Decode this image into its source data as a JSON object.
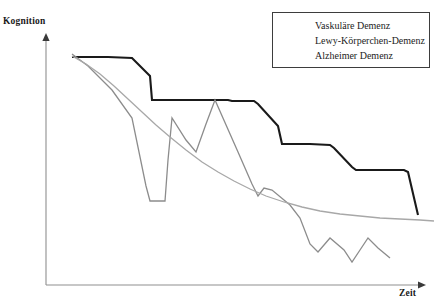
{
  "chart_data": {
    "type": "line",
    "title": "",
    "xlabel": "Zeit",
    "ylabel": "Kognition",
    "grid": false,
    "axes_style": "arrow-ended L-shaped axes, no tick labels",
    "legend_position": "top-right",
    "xlim": [
      0,
      100
    ],
    "ylim": [
      0,
      100
    ],
    "series": [
      {
        "name": "Vaskuläre Demenz",
        "color": "#1a1a1a",
        "width": 2.1,
        "shape": "descending staircase with flat plateaus and abrupt drops",
        "points": [
          [
            72,
            57
          ],
          [
            105,
            57
          ],
          [
            108,
            57
          ],
          [
            132,
            58
          ],
          [
            150,
            76
          ],
          [
            152,
            100
          ],
          [
            190,
            100
          ],
          [
            228,
            100
          ],
          [
            232,
            101
          ],
          [
            254,
            101
          ],
          [
            258,
            104
          ],
          [
            278,
            126
          ],
          [
            282,
            144
          ],
          [
            310,
            144
          ],
          [
            330,
            145
          ],
          [
            334,
            148
          ],
          [
            352,
            167
          ],
          [
            356,
            170
          ],
          [
            390,
            170
          ],
          [
            404,
            170
          ],
          [
            408,
            172
          ],
          [
            418,
            215
          ]
        ]
      },
      {
        "name": "Lewy-Körperchen-Demenz",
        "color": "#8c8c8c",
        "width": 1.3,
        "shape": "steeply fluctuating zigzag with deep troughs and sharp peaks",
        "points": [
          [
            72,
            54
          ],
          [
            88,
            66
          ],
          [
            112,
            90
          ],
          [
            132,
            118
          ],
          [
            146,
            186
          ],
          [
            150,
            201
          ],
          [
            165,
            201
          ],
          [
            168,
            160
          ],
          [
            172,
            118
          ],
          [
            186,
            140
          ],
          [
            196,
            152
          ],
          [
            206,
            124
          ],
          [
            215,
            100
          ],
          [
            238,
            152
          ],
          [
            252,
            184
          ],
          [
            258,
            196
          ],
          [
            264,
            188
          ],
          [
            272,
            190
          ],
          [
            290,
            205
          ],
          [
            300,
            218
          ],
          [
            310,
            244
          ],
          [
            318,
            252
          ],
          [
            330,
            238
          ],
          [
            344,
            250
          ],
          [
            352,
            262
          ],
          [
            360,
            250
          ],
          [
            368,
            238
          ],
          [
            378,
            248
          ],
          [
            390,
            258
          ]
        ]
      },
      {
        "name": "Alzheimer Demenz",
        "color": "#a8a8a8",
        "width": 1.3,
        "shape": "smooth gradual exponential-like decay flattening to a plateau",
        "points": [
          [
            72,
            56
          ],
          [
            86,
            64
          ],
          [
            100,
            74
          ],
          [
            114,
            86
          ],
          [
            128,
            99
          ],
          [
            142,
            112
          ],
          [
            156,
            125
          ],
          [
            170,
            137
          ],
          [
            186,
            150
          ],
          [
            202,
            162
          ],
          [
            218,
            172
          ],
          [
            234,
            181
          ],
          [
            250,
            189
          ],
          [
            266,
            196
          ],
          [
            284,
            202
          ],
          [
            302,
            207
          ],
          [
            320,
            211
          ],
          [
            340,
            214
          ],
          [
            360,
            216
          ],
          [
            380,
            218
          ],
          [
            400,
            219
          ],
          [
            420,
            220
          ],
          [
            434,
            221
          ]
        ]
      }
    ]
  },
  "axes": {
    "y_axis": {
      "label": "Kognition",
      "arrow": "up-arrow-icon",
      "color": "#8f8f8f",
      "x": 46,
      "top": 33,
      "bottom": 285
    },
    "x_axis": {
      "label": "Zeit",
      "arrow": "right-arrow-icon",
      "color": "#8f8f8f",
      "y": 285,
      "left": 46,
      "right": 426
    }
  },
  "legend": {
    "entries": [
      {
        "label": "Vaskuläre Demenz",
        "color": "#1a1a1a",
        "width": 2.1
      },
      {
        "label": "Lewy-Körperchen-Demenz",
        "color": "#8c8c8c",
        "width": 1.3
      },
      {
        "label": "Alzheimer Demenz",
        "color": "#a8a8a8",
        "width": 1.3
      }
    ]
  }
}
